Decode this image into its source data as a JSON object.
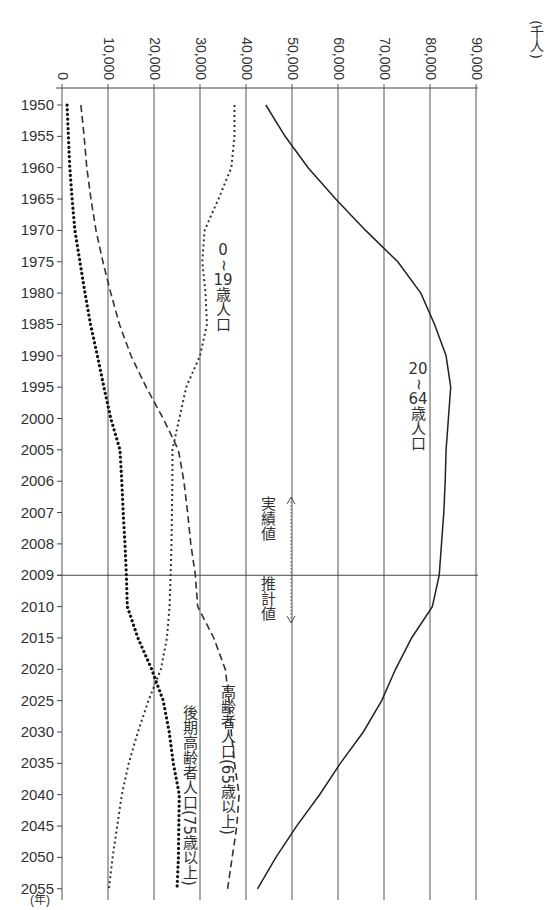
{
  "chart_data": {
    "type": "line",
    "orientation": "rotated-vertical-time-axis",
    "title": "",
    "xlabel": "(年)",
    "ylabel": "(千人)",
    "value_unit": "(千人)",
    "time_unit": "(年)",
    "value_ticks": [
      0,
      10000,
      20000,
      30000,
      40000,
      50000,
      60000,
      70000,
      80000,
      90000
    ],
    "value_tick_labels": [
      "0",
      "10,000",
      "20,000",
      "30,000",
      "40,000",
      "50,000",
      "60,000",
      "70,000",
      "80,000",
      "90,000"
    ],
    "value_range": [
      0,
      90000
    ],
    "categories": [
      "1950",
      "1955",
      "1960",
      "1965",
      "1970",
      "1975",
      "1980",
      "1985",
      "1990",
      "1995",
      "2000",
      "2005",
      "2006",
      "2007",
      "2008",
      "2009",
      "2010",
      "2015",
      "2020",
      "2025",
      "2030",
      "2035",
      "2040",
      "2045",
      "2050",
      "2055"
    ],
    "grid": true,
    "divider_year": "2009",
    "annotations": {
      "actual": "実績値",
      "projected": "推計値"
    },
    "series": [
      {
        "name": "20~64歳人口",
        "label_lines": [
          "20",
          "~",
          "64",
          "歳",
          "人",
          "口"
        ],
        "style": "solid",
        "values": [
          44300,
          48500,
          53500,
          59500,
          66000,
          73000,
          78000,
          81000,
          83500,
          84500,
          84000,
          83500,
          83300,
          83000,
          82500,
          82000,
          80500,
          76000,
          72500,
          69500,
          65500,
          60500,
          56000,
          51000,
          46500,
          42500
        ]
      },
      {
        "name": "0~19歳人口",
        "label_lines": [
          "0",
          "~",
          "19",
          "歳",
          "人",
          "口"
        ],
        "style": "dotted",
        "values": [
          37500,
          37500,
          36800,
          34000,
          31000,
          30500,
          31200,
          31500,
          30000,
          27000,
          25500,
          24000,
          24000,
          23900,
          23800,
          23600,
          23400,
          22800,
          21500,
          18800,
          16500,
          14500,
          13000,
          12000,
          11000,
          10200
        ]
      },
      {
        "name": "高齢者人口(65歳以上)",
        "label_lines": [
          "高齢者人口(65歳以上)"
        ],
        "style": "dashed",
        "values": [
          4100,
          4800,
          5400,
          6300,
          7400,
          8900,
          10600,
          12500,
          15000,
          18300,
          22000,
          25300,
          26500,
          27300,
          28000,
          29000,
          29500,
          33000,
          35500,
          36300,
          36800,
          37500,
          38500,
          38000,
          37000,
          36000
        ]
      },
      {
        "name": "後期高齢者人口(75歳以上)",
        "label_lines": [
          "後期高齢者人口(75歳以上)"
        ],
        "style": "heavy-dotted",
        "values": [
          1100,
          1400,
          1700,
          2200,
          2800,
          3900,
          5000,
          6200,
          7700,
          9100,
          10600,
          12600,
          13000,
          13300,
          13700,
          14000,
          14200,
          16500,
          19500,
          22000,
          23300,
          24200,
          25500,
          25400,
          25300,
          25000
        ]
      }
    ]
  },
  "labels": {
    "unit": "(千人)",
    "year_unit": "(年)",
    "series_20_64": "20~64歳人口",
    "series_0_19": "0~19歳人口",
    "series_65": "高齢者人口(65歳以上)",
    "series_75": "後期高齢者人口(75歳以上)",
    "actual": "実績値",
    "projected": "推計値"
  }
}
